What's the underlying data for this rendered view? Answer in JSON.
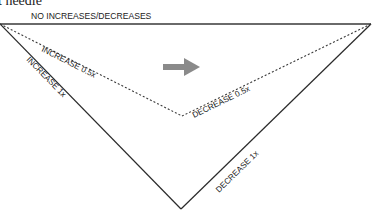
{
  "caption_fragment": "t needle",
  "diagram": {
    "top_label": "NO INCREASES/DECREASES",
    "labels": {
      "increase_half": "INCREASE 0.5x",
      "increase_full": "INCREASE 1x",
      "decrease_half": "DECREASE 0.5x",
      "decrease_full": "DECREASE 1x"
    },
    "arrow": {
      "direction": "right",
      "color": "#8a8a8a"
    },
    "colors": {
      "top_line": "#6a6a6a",
      "solid_lines": "#2a2a2a",
      "dotted_lines": "#3a3a3a",
      "text": "#222222"
    }
  }
}
